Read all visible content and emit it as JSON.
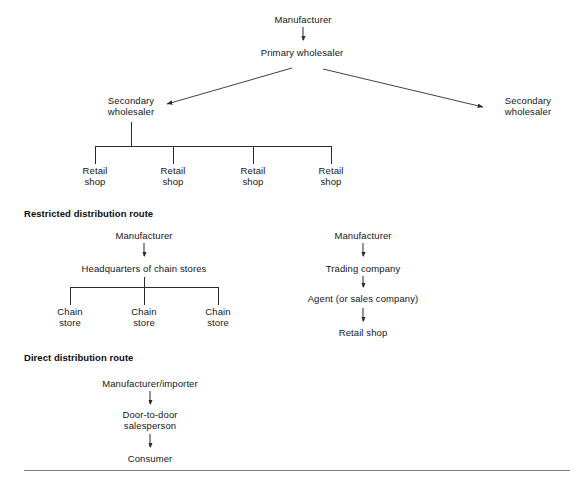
{
  "page": {
    "line_color": "#2a2b30",
    "text_color": "#15161a",
    "rule_color": "#7d7f86",
    "background": "#ffffff"
  },
  "sections": [
    {
      "id": "general-distribution-route",
      "heading": "",
      "nodes": {
        "manufacturer": "Manufacturer",
        "primary_wholesaler": "Primary wholesaler",
        "secondary_wholesaler_left_line1": "Secondary",
        "secondary_wholesaler_left_line2": "wholesaler",
        "secondary_wholesaler_right_line1": "Secondary",
        "secondary_wholesaler_right_line2": "wholesaler",
        "retail_shop_line1": "Retail",
        "retail_shop_line2": "shop"
      },
      "retail_shops": [
        {
          "line1": "Retail",
          "line2": "shop"
        },
        {
          "line1": "Retail",
          "line2": "shop"
        },
        {
          "line1": "Retail",
          "line2": "shop"
        },
        {
          "line1": "Retail",
          "line2": "shop"
        }
      ]
    },
    {
      "id": "restricted-distribution-route",
      "heading": "Restricted distribution route",
      "left_chain": {
        "manufacturer": "Manufacturer",
        "headquarters": "Headquarters of chain stores",
        "stores": [
          {
            "line1": "Chain",
            "line2": "store"
          },
          {
            "line1": "Chain",
            "line2": "store"
          },
          {
            "line1": "Chain",
            "line2": "store"
          }
        ]
      },
      "right_chain": {
        "manufacturer": "Manufacturer",
        "trading_company": "Trading company",
        "agent": "Agent (or sales company)",
        "retail_shop": "Retail shop"
      }
    },
    {
      "id": "direct-distribution-route",
      "heading": "Direct distribution route",
      "chain": {
        "manufacturer_importer": "Manufacturer/importer",
        "salesperson_line1": "Door-to-door",
        "salesperson_line2": "salesperson",
        "consumer": "Consumer"
      }
    }
  ]
}
